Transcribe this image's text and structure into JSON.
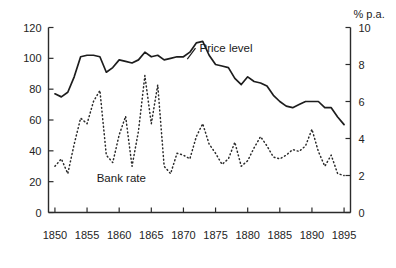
{
  "chart_data": {
    "type": "line",
    "title": "",
    "subtitle": "",
    "xlabel": "",
    "ylabel": "",
    "y2label": "% p.a.",
    "grid": false,
    "legend_position": "inline-annotations",
    "xlim": [
      1849,
      1896
    ],
    "ylim": [
      0,
      120
    ],
    "y2lim": [
      0,
      10
    ],
    "xticks": [
      1850,
      1855,
      1860,
      1865,
      1870,
      1875,
      1880,
      1885,
      1890,
      1895
    ],
    "xtick_labels": [
      "1850",
      "1855",
      "1860",
      "1865",
      "1870",
      "1875",
      "1880",
      "1885",
      "1890",
      "1895"
    ],
    "yticks": [
      0,
      20,
      40,
      60,
      80,
      100,
      120
    ],
    "ytick_labels": [
      "0",
      "20",
      "40",
      "60",
      "80",
      "100",
      "120"
    ],
    "y2ticks": [
      0,
      2,
      4,
      6,
      8,
      10
    ],
    "y2tick_labels": [
      "0",
      "2",
      "4",
      "6",
      "8",
      "10"
    ],
    "annotations": [
      {
        "text": "Price level",
        "x": 1872.5,
        "y": 104
      },
      {
        "text": "Bank rate",
        "x": 1856.5,
        "y": 20
      },
      {
        "text": "% p.a.",
        "x": 1895.5,
        "y": 118
      }
    ],
    "series": [
      {
        "name": "Price level",
        "axis": "left",
        "style": "solid",
        "x": [
          1850,
          1851,
          1852,
          1853,
          1854,
          1855,
          1856,
          1857,
          1858,
          1859,
          1860,
          1861,
          1862,
          1863,
          1864,
          1865,
          1866,
          1867,
          1868,
          1869,
          1870,
          1871,
          1872,
          1873,
          1874,
          1875,
          1876,
          1877,
          1878,
          1879,
          1880,
          1881,
          1882,
          1883,
          1884,
          1885,
          1886,
          1887,
          1888,
          1889,
          1890,
          1891,
          1892,
          1893,
          1894,
          1895
        ],
        "values": [
          77,
          75,
          78,
          88,
          101,
          102,
          102,
          101,
          91,
          94,
          99,
          98,
          97,
          99,
          104,
          101,
          102,
          99,
          100,
          101,
          101,
          104,
          110,
          111,
          102,
          96,
          95,
          94,
          87,
          83,
          88,
          85,
          84,
          82,
          76,
          72,
          69,
          68,
          70,
          72,
          72,
          72,
          68,
          68,
          62,
          57
        ]
      },
      {
        "name": "Bank rate",
        "axis": "right",
        "style": "dotted",
        "x": [
          1850,
          1851,
          1852,
          1853,
          1854,
          1855,
          1856,
          1857,
          1858,
          1859,
          1860,
          1861,
          1862,
          1863,
          1864,
          1865,
          1866,
          1867,
          1868,
          1869,
          1870,
          1871,
          1872,
          1873,
          1874,
          1875,
          1876,
          1877,
          1878,
          1879,
          1880,
          1881,
          1882,
          1883,
          1884,
          1885,
          1886,
          1887,
          1888,
          1889,
          1890,
          1891,
          1892,
          1893,
          1894,
          1895
        ],
        "values": [
          2.5,
          2.9,
          2.1,
          3.7,
          5.1,
          4.8,
          6.0,
          6.6,
          3.1,
          2.7,
          4.2,
          5.2,
          2.5,
          4.4,
          7.4,
          4.8,
          6.9,
          2.5,
          2.1,
          3.2,
          3.1,
          2.9,
          4.1,
          4.8,
          3.7,
          3.2,
          2.6,
          2.9,
          3.8,
          2.5,
          2.8,
          3.5,
          4.1,
          3.6,
          3.0,
          2.9,
          3.1,
          3.4,
          3.3,
          3.6,
          4.5,
          3.3,
          2.5,
          3.1,
          2.1,
          2.0
        ]
      }
    ]
  },
  "figure": {
    "background": "#ffffff",
    "ink_color": "#1d1d1d"
  }
}
